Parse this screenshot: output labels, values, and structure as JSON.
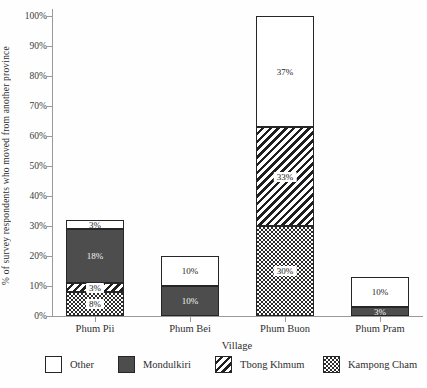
{
  "chart_data": {
    "type": "bar",
    "stacked": true,
    "title": "",
    "xlabel": "Village",
    "ylabel": "% of survey respondents who moved from another province",
    "categories": [
      "Phum Pii",
      "Phum Bei",
      "Phum Buon",
      "Phum Pram"
    ],
    "series": [
      {
        "name": "Kampong Cham",
        "pattern": "dots",
        "values": [
          8,
          0,
          30,
          0
        ]
      },
      {
        "name": "Tbong Khmum",
        "pattern": "stripes",
        "values": [
          3,
          0,
          33,
          0
        ]
      },
      {
        "name": "Mondulkiri",
        "pattern": "solid",
        "color": "#4d4d4d",
        "values": [
          18,
          10,
          0,
          3
        ]
      },
      {
        "name": "Other",
        "pattern": "plain",
        "color": "#ffffff",
        "values": [
          3,
          10,
          37,
          10
        ]
      }
    ],
    "segment_labels": {
      "Phum Pii": {
        "Kampong Cham": "8%",
        "Tbong Khmum": "3%",
        "Mondulkiri": "18%",
        "Other": "3%"
      },
      "Phum Bei": {
        "Mondulkiri": "10%",
        "Other": "10%"
      },
      "Phum Buon": {
        "Kampong Cham": "30%",
        "Tbong Khmum": "33%",
        "Other": "37%"
      },
      "Phum Pram": {
        "Mondulkiri": "3%",
        "Other": "10%"
      }
    },
    "ylim": [
      0,
      100
    ],
    "ytick_step": 10,
    "ytick_labels": [
      "0%",
      "10%",
      "20%",
      "30%",
      "40%",
      "50%",
      "60%",
      "70%",
      "80%",
      "90%",
      "100%"
    ],
    "grid": false,
    "legend": {
      "position": "bottom",
      "order": [
        "Other",
        "Mondulkiri",
        "Tbong Khmum",
        "Kampong Cham"
      ]
    },
    "colors": {
      "solid_fill": "#4d4d4d",
      "pattern_ink": "#1f1f1f",
      "axis": "#9a9a9a",
      "text": "#2e2e2e"
    }
  }
}
